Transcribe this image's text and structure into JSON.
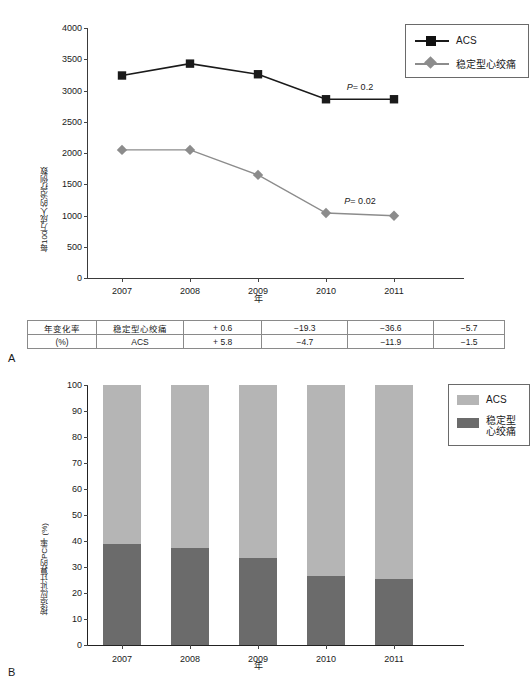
{
  "panels": {
    "a_label": "A",
    "b_label": "B"
  },
  "chart_data": [
    {
      "type": "line",
      "panel": "A",
      "title": "",
      "xlabel": "年",
      "ylabel": "每100万成人的治疗例数",
      "categories": [
        "2007",
        "2008",
        "2009",
        "2010",
        "2011"
      ],
      "ylim": [
        0,
        4000
      ],
      "yticks": [
        "0",
        "500",
        "1000",
        "1500",
        "2000",
        "2500",
        "3000",
        "3500",
        "4000"
      ],
      "grid": false,
      "legend_position": "top-right",
      "series": [
        {
          "name": "ACS",
          "values": [
            3240,
            3430,
            3260,
            2860,
            2860
          ],
          "color": "#1a1a1a",
          "marker": "square"
        },
        {
          "name": "稳定型心绞痛",
          "values": [
            2050,
            2050,
            1650,
            1040,
            995
          ],
          "color": "#8c8c8c",
          "marker": "diamond"
        }
      ],
      "annotations": [
        {
          "text_italic": "P",
          "text": "= 0.2",
          "x": 2010.5,
          "y": 3000
        },
        {
          "text_italic": "P",
          "text": "= 0.02",
          "x": 2010.5,
          "y": 1180
        }
      ]
    },
    {
      "type": "bar",
      "panel": "B",
      "stacked": true,
      "title": "",
      "xlabel": "年",
      "ylabel": "按适应证计算的PCI率 (%)",
      "categories": [
        "2007",
        "2008",
        "2009",
        "2010",
        "2011"
      ],
      "ylim": [
        0,
        100
      ],
      "yticks": [
        "0",
        "10",
        "20",
        "30",
        "40",
        "50",
        "60",
        "70",
        "80",
        "90",
        "100"
      ],
      "grid": false,
      "legend_position": "right",
      "series": [
        {
          "name": "稳定型心绞痛",
          "values": [
            38.8,
            37.3,
            33.5,
            26.5,
            25.2
          ],
          "color": "#6b6b6b"
        },
        {
          "name": "ACS",
          "values": [
            61.2,
            62.7,
            66.5,
            73.5,
            74.8
          ],
          "color": "#b5b5b5"
        }
      ]
    }
  ],
  "table": {
    "row_header_line1": "年变化率",
    "row_header_line2": "(%)",
    "rows": [
      {
        "category": "稳定型心绞痛",
        "values": [
          "+ 0.6",
          "−19.3",
          "−36.6",
          "−5.7"
        ]
      },
      {
        "category": "ACS",
        "values": [
          "+ 5.8",
          "−4.7",
          "−11.9",
          "−1.5"
        ]
      }
    ]
  },
  "legend_a": {
    "items": [
      {
        "label": "ACS",
        "marker": "square",
        "color": "#1a1a1a"
      },
      {
        "label": "稳定型心绞痛",
        "marker": "diamond",
        "color": "#8c8c8c"
      }
    ]
  },
  "legend_b": {
    "items": [
      {
        "label": "ACS",
        "color": "#b5b5b5"
      },
      {
        "label_line1": "稳定型",
        "label_line2": "心绞痛",
        "color": "#6b6b6b"
      }
    ]
  }
}
